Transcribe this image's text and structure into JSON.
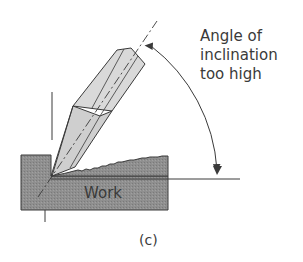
{
  "diagram": {
    "annotation": {
      "line1": "Angle of",
      "line2": "inclination",
      "line3": "too high"
    },
    "work_label": "Work",
    "caption": "(c)"
  },
  "colors": {
    "work_fill": "#8c8c8c",
    "tool_fill": "#d9d9d9",
    "tool_shade": "#c4c4c4",
    "stroke": "#3a3a3a"
  }
}
